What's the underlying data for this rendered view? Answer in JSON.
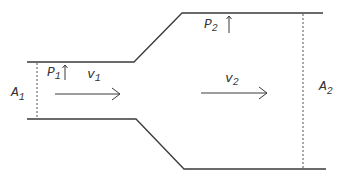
{
  "diagram": {
    "labels": {
      "A1": {
        "main": "A",
        "sub": "1"
      },
      "P1": {
        "main": "P",
        "sub": "1"
      },
      "v1": {
        "main": "v",
        "sub": "1"
      },
      "P2": {
        "main": "P",
        "sub": "2"
      },
      "v2": {
        "main": "v",
        "sub": "2"
      },
      "A2": {
        "main": "A",
        "sub": "2"
      }
    },
    "colors": {
      "line": "#3a3a3a",
      "text": "#333333",
      "background": "#ffffff"
    }
  }
}
